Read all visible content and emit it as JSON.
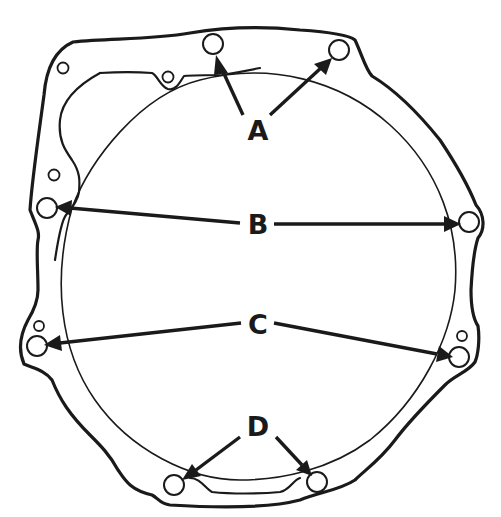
{
  "diagram": {
    "type": "technical-illustration",
    "colors": {
      "line": "#1a1a1a",
      "background": "#ffffff"
    },
    "callouts": [
      {
        "label": "A",
        "x": 258,
        "y": 137,
        "targets": [
          [
            213,
            47
          ],
          [
            337,
            52
          ]
        ]
      },
      {
        "label": "B",
        "x": 258,
        "y": 231,
        "targets": [
          [
            49,
            208
          ],
          [
            467,
            223
          ]
        ]
      },
      {
        "label": "C",
        "x": 258,
        "y": 331,
        "targets": [
          [
            37,
            347
          ],
          [
            458,
            357
          ]
        ]
      },
      {
        "label": "D",
        "x": 258,
        "y": 433,
        "targets": [
          [
            176,
            483
          ],
          [
            316,
            480
          ]
        ]
      }
    ],
    "bolt_holes": [
      {
        "id": "A1",
        "cx": 213,
        "cy": 44,
        "r": 10
      },
      {
        "id": "A2",
        "cx": 339,
        "cy": 50,
        "r": 10
      },
      {
        "id": "B1",
        "cx": 47,
        "cy": 208,
        "r": 10
      },
      {
        "id": "B2",
        "cx": 469,
        "cy": 222,
        "r": 10
      },
      {
        "id": "C1",
        "cx": 37,
        "cy": 346,
        "r": 10
      },
      {
        "id": "C2",
        "cx": 459,
        "cy": 357,
        "r": 10
      },
      {
        "id": "D1",
        "cx": 174,
        "cy": 485,
        "r": 10
      },
      {
        "id": "D2",
        "cx": 317,
        "cy": 482,
        "r": 10
      }
    ],
    "small_holes": [
      {
        "cx": 63,
        "cy": 68,
        "r": 5.5
      },
      {
        "cx": 168,
        "cy": 77,
        "r": 5.5
      },
      {
        "cx": 54,
        "cy": 175,
        "r": 5.5
      },
      {
        "cx": 39,
        "cy": 326,
        "r": 5
      },
      {
        "cx": 462,
        "cy": 336,
        "r": 5
      }
    ]
  }
}
